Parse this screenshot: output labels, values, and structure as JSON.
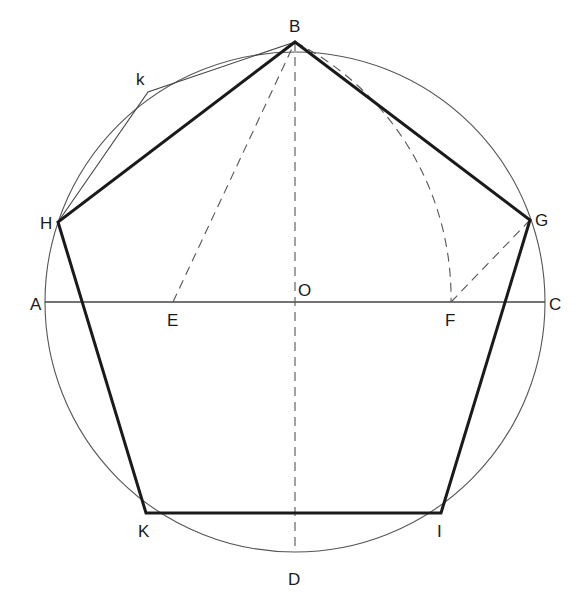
{
  "diagram": {
    "circle": {
      "cx": 295,
      "cy": 302,
      "r": 250
    },
    "points": {
      "A": {
        "label": "A",
        "x": 45,
        "y": 302,
        "lx": 30,
        "ly": 310
      },
      "B": {
        "label": "B",
        "x": 295,
        "y": 42,
        "lx": 289,
        "ly": 32
      },
      "C": {
        "label": "C",
        "x": 545,
        "y": 302,
        "lx": 549,
        "ly": 310
      },
      "D": {
        "label": "D",
        "x": 295,
        "y": 552,
        "lx": 288,
        "ly": 585
      },
      "O": {
        "label": "O",
        "x": 295,
        "y": 302,
        "lx": 297,
        "ly": 295
      },
      "E": {
        "label": "E",
        "x": 173,
        "y": 302,
        "lx": 167,
        "ly": 325
      },
      "F": {
        "label": "F",
        "x": 451,
        "y": 302,
        "lx": 444,
        "ly": 325
      },
      "G": {
        "label": "G",
        "x": 530,
        "y": 220,
        "lx": 535,
        "ly": 226
      },
      "H": {
        "label": "H",
        "x": 58,
        "y": 222,
        "lx": 40,
        "ly": 229
      },
      "K": {
        "label": "K",
        "x": 146,
        "y": 513,
        "lx": 138,
        "ly": 536
      },
      "I": {
        "label": "I",
        "x": 441,
        "y": 513,
        "lx": 437,
        "ly": 536
      },
      "k": {
        "label": "k",
        "x": 148,
        "y": 92,
        "lx": 136,
        "ly": 85
      }
    },
    "colors": {
      "stroke": "#1a1a1a",
      "thin": "#555555",
      "dashed": "#555555",
      "background": "#ffffff"
    }
  }
}
